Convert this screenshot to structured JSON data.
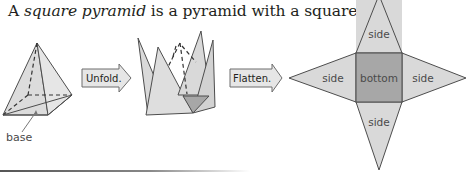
{
  "caption": {
    "prefix": "A ",
    "term": "square pyramid",
    "suffix": " is a pyramid with a square base."
  },
  "figures": {
    "pyramid": {
      "label": "base"
    },
    "unfold_arrow": {
      "label": "Unfold."
    },
    "flatten_arrow": {
      "label": "Flatten."
    },
    "net": {
      "faces": {
        "top": "side",
        "left": "side",
        "center": "bottom",
        "right": "side",
        "bottom": "side"
      }
    }
  },
  "colors": {
    "side_fill": "#d9d9d9",
    "base_fill": "#a7a7a7",
    "stroke": "#4d4d4d",
    "arrow_fill": "#e6e6e6"
  }
}
